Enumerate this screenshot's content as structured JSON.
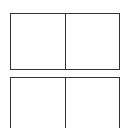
{
  "panels": [
    {
      "id": "top",
      "cells": [
        "",
        ""
      ]
    },
    {
      "id": "bottom",
      "cells": [
        "",
        ""
      ]
    }
  ],
  "colors": {
    "border": "#333333",
    "background": "#ffffff"
  }
}
